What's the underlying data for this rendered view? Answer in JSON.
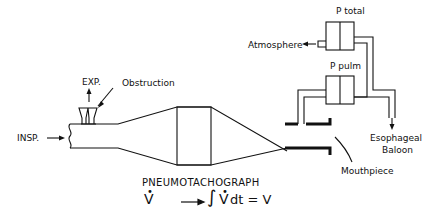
{
  "diagram": {
    "title": "PNEUMOTACHOGRAPH",
    "equation": "V̇ → ∫V̇dt = V",
    "labels": {
      "p_total": "P total",
      "atmosphere": "Atmosphere",
      "p_pulm": "P pulm",
      "exp": "EXP.",
      "obstruction": "Obstruction",
      "insp": "INSP.",
      "esophageal_1": "Esophageal",
      "esophageal_2": "Baloon",
      "mouthpiece": "Mouthpiece"
    },
    "equation_parts": {
      "vdot": "V",
      "integral": "∫",
      "vdot2": "V",
      "rest": "dt = V"
    },
    "colors": {
      "line": "#111111",
      "background": "#ffffff"
    }
  }
}
